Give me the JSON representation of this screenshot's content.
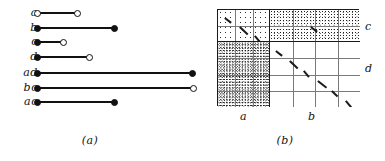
{
  "figure": {
    "caption_a": "(a)",
    "caption_b": "(b)"
  },
  "panel_a": {
    "name": "interval-diagram",
    "axis_origin_x": 38,
    "rows": [
      {
        "label": "a",
        "start": 38,
        "end": 78,
        "y": 12,
        "start_style": "open",
        "end_style": "open"
      },
      {
        "label": "b",
        "start": 38,
        "end": 115,
        "y": 27,
        "start_style": "filled",
        "end_style": "filled"
      },
      {
        "label": "c",
        "start": 38,
        "end": 64,
        "y": 41,
        "start_style": "filled",
        "end_style": "open"
      },
      {
        "label": "d",
        "start": 38,
        "end": 90,
        "y": 56,
        "start_style": "filled",
        "end_style": "open"
      },
      {
        "label": "ad",
        "start": 38,
        "end": 193,
        "y": 72,
        "start_style": "filled",
        "end_style": "filled"
      },
      {
        "label": "bc",
        "start": 38,
        "end": 194,
        "y": 87,
        "start_style": "filled",
        "end_style": "open"
      },
      {
        "label": "ac",
        "start": 38,
        "end": 115,
        "y": 101,
        "start_style": "filled",
        "end_style": "filled"
      }
    ]
  },
  "panel_b": {
    "name": "contingency-grid",
    "col_groups": [
      {
        "label": "a",
        "cells": 3,
        "width": 52
      },
      {
        "label": "b",
        "cells": 4,
        "width": 90
      }
    ],
    "row_groups": [
      {
        "label": "c",
        "cells": 2,
        "height": 32
      },
      {
        "label": "d",
        "cells": 4,
        "height": 65
      }
    ],
    "quadrants": [
      {
        "id": "ac",
        "col": "a",
        "row": "c",
        "shading": "light",
        "dashes": 3
      },
      {
        "id": "bc",
        "col": "b",
        "row": "c",
        "shading": "dense",
        "dashes": 1
      },
      {
        "id": "ad",
        "col": "a",
        "row": "d",
        "shading": "heavy",
        "dashes": 0
      },
      {
        "id": "bd",
        "col": "b",
        "row": "d",
        "shading": "none",
        "dashes": 6
      }
    ],
    "labels": {
      "bottom_a": "a",
      "bottom_b": "b",
      "right_c": "c",
      "right_d": "d"
    }
  },
  "colors": {
    "ink": "#1a1a1a",
    "gridline": "#7a7a7a",
    "paper": "#ffffff"
  }
}
